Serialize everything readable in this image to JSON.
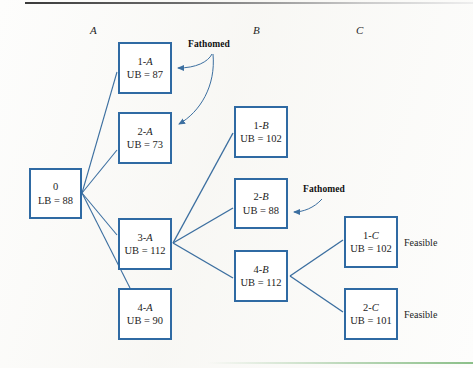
{
  "figure": {
    "type": "branch-and-bound-tree-diagram",
    "columns": [
      {
        "label": "A",
        "x": 94
      },
      {
        "label": "B",
        "x": 257
      },
      {
        "label": "C",
        "x": 360
      }
    ],
    "nodes": [
      {
        "id": "root",
        "line1": "0",
        "line1_suffix": "",
        "line2": "LB = 88",
        "x": 29,
        "y": 168,
        "w": 53,
        "h": 51
      },
      {
        "id": "1A",
        "line1": "1-",
        "line1_suffix": "A",
        "line2": "UB = 87",
        "x": 118,
        "y": 42,
        "w": 54,
        "h": 52
      },
      {
        "id": "2A",
        "line1": "2-",
        "line1_suffix": "A",
        "line2": "UB = 73",
        "x": 118,
        "y": 112,
        "w": 54,
        "h": 52
      },
      {
        "id": "3A",
        "line1": "3-",
        "line1_suffix": "A",
        "line2": "UB = 112",
        "x": 118,
        "y": 218,
        "w": 54,
        "h": 52
      },
      {
        "id": "4A",
        "line1": "4-",
        "line1_suffix": "A",
        "line2": "UB = 90",
        "x": 118,
        "y": 288,
        "w": 54,
        "h": 52
      },
      {
        "id": "1B",
        "line1": "1-",
        "line1_suffix": "B",
        "line2": "UB = 102",
        "x": 234,
        "y": 106,
        "w": 54,
        "h": 52
      },
      {
        "id": "2B",
        "line1": "2-",
        "line1_suffix": "B",
        "line2": "UB = 88",
        "x": 234,
        "y": 178,
        "w": 54,
        "h": 51
      },
      {
        "id": "4B",
        "line1": "4-",
        "line1_suffix": "B",
        "line2": "UB = 112",
        "x": 234,
        "y": 250,
        "w": 54,
        "h": 52
      },
      {
        "id": "1C",
        "line1": "1-",
        "line1_suffix": "C",
        "line2": "UB = 102",
        "x": 344,
        "y": 216,
        "w": 54,
        "h": 52
      },
      {
        "id": "2C",
        "line1": "2-",
        "line1_suffix": "C",
        "line2": "UB = 101",
        "x": 344,
        "y": 288,
        "w": 54,
        "h": 52
      }
    ],
    "edges": [
      {
        "from": "root",
        "to": "1A"
      },
      {
        "from": "root",
        "to": "2A"
      },
      {
        "from": "root",
        "to": "3A"
      },
      {
        "from": "root",
        "to": "4A"
      },
      {
        "from": "3A",
        "to": "1B"
      },
      {
        "from": "3A",
        "to": "2B"
      },
      {
        "from": "3A",
        "to": "4B"
      },
      {
        "from": "4B",
        "to": "1C"
      },
      {
        "from": "4B",
        "to": "2C"
      }
    ],
    "annotations": [
      {
        "id": "fathomed-1",
        "text": "Fathomed",
        "x": 188,
        "y": 39,
        "targets": [
          "1A",
          "2A"
        ]
      },
      {
        "id": "fathomed-2",
        "text": "Fathomed",
        "x": 303,
        "y": 184,
        "targets": [
          "2B"
        ]
      }
    ],
    "side_labels": [
      {
        "id": "feasible-1c",
        "text": "Feasible",
        "x": 404,
        "y": 237
      },
      {
        "id": "feasible-2c",
        "text": "Feasible",
        "x": 404,
        "y": 309
      }
    ],
    "colors": {
      "node_border": "#2f6aa3",
      "edge_line": "#3c6fa0",
      "node_fill": "#ffffff",
      "text": "#1d1d1d",
      "page_background": "#fdfdfc",
      "top_rule": "#3b3b3b",
      "bottom_rule": "#8cc08a"
    }
  }
}
